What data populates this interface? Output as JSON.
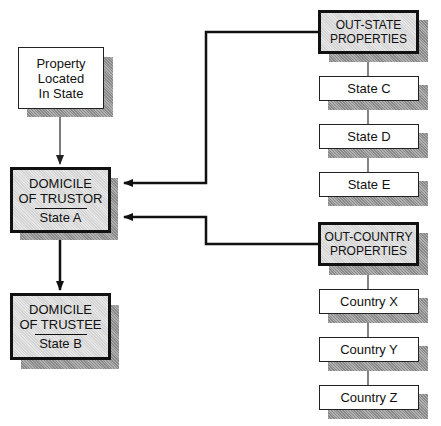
{
  "nodes": {
    "property_in_state": {
      "lines": [
        "Property",
        "Located",
        "In State"
      ]
    },
    "trustor": {
      "title_1": "DOMICILE",
      "title_2": "OF TRUSTOR",
      "sub": "State A"
    },
    "trustee": {
      "title_1": "DOMICILE",
      "title_2": "OF TRUSTEE",
      "sub": "State B"
    },
    "out_state": {
      "title_1": "OUT-STATE",
      "title_2": "PROPERTIES",
      "children": [
        "State C",
        "State D",
        "State E"
      ]
    },
    "out_country": {
      "title_1": "OUT-COUNTRY",
      "title_2": "PROPERTIES",
      "children": [
        "Country X",
        "Country Y",
        "Country Z"
      ]
    }
  },
  "edges": [
    {
      "from": "property_in_state",
      "to": "trustor"
    },
    {
      "from": "trustor",
      "to": "trustee"
    },
    {
      "from": "out_state",
      "to": "trustor"
    },
    {
      "from": "out_country",
      "to": "trustor"
    }
  ]
}
